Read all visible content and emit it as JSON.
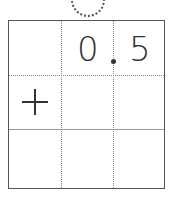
{
  "digits": {
    "units": "0",
    "tenths": "5"
  },
  "operator": "plus-icon",
  "decimal_point": "."
}
